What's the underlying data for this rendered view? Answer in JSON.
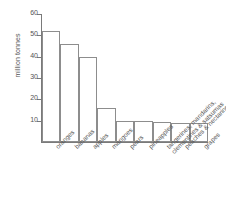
{
  "chart_data": {
    "type": "bar",
    "title": "",
    "subtitle": "",
    "xlabel": "",
    "ylabel": "million tonnes",
    "ylim": [
      0,
      60
    ],
    "yticks": [
      10,
      20,
      30,
      40,
      50,
      60
    ],
    "grid": false,
    "legend": null,
    "categories": [
      "oranges",
      "bananas",
      "apples",
      "mangoes",
      "pears",
      "pineapples",
      "tangerines, mandarins, clementines & satsumas",
      "peaches & nectarines",
      "grapes"
    ],
    "category_lines": [
      [
        "oranges"
      ],
      [
        "bananas"
      ],
      [
        "apples"
      ],
      [
        "mangoes"
      ],
      [
        "pears"
      ],
      [
        "pineapples"
      ],
      [
        "tangerines, mandarins,",
        "clementines & satsumas"
      ],
      [
        "peaches & nectarines"
      ],
      [
        "grapes"
      ]
    ],
    "values": [
      52,
      46,
      40,
      16,
      10,
      9.8,
      9.2,
      9,
      8.8
    ],
    "bar_fill": "#ffffff",
    "bar_stroke": "#8d8d8d",
    "axis_color": "#7a7a7a",
    "text_color": "#555555",
    "background": "#ffffff"
  }
}
